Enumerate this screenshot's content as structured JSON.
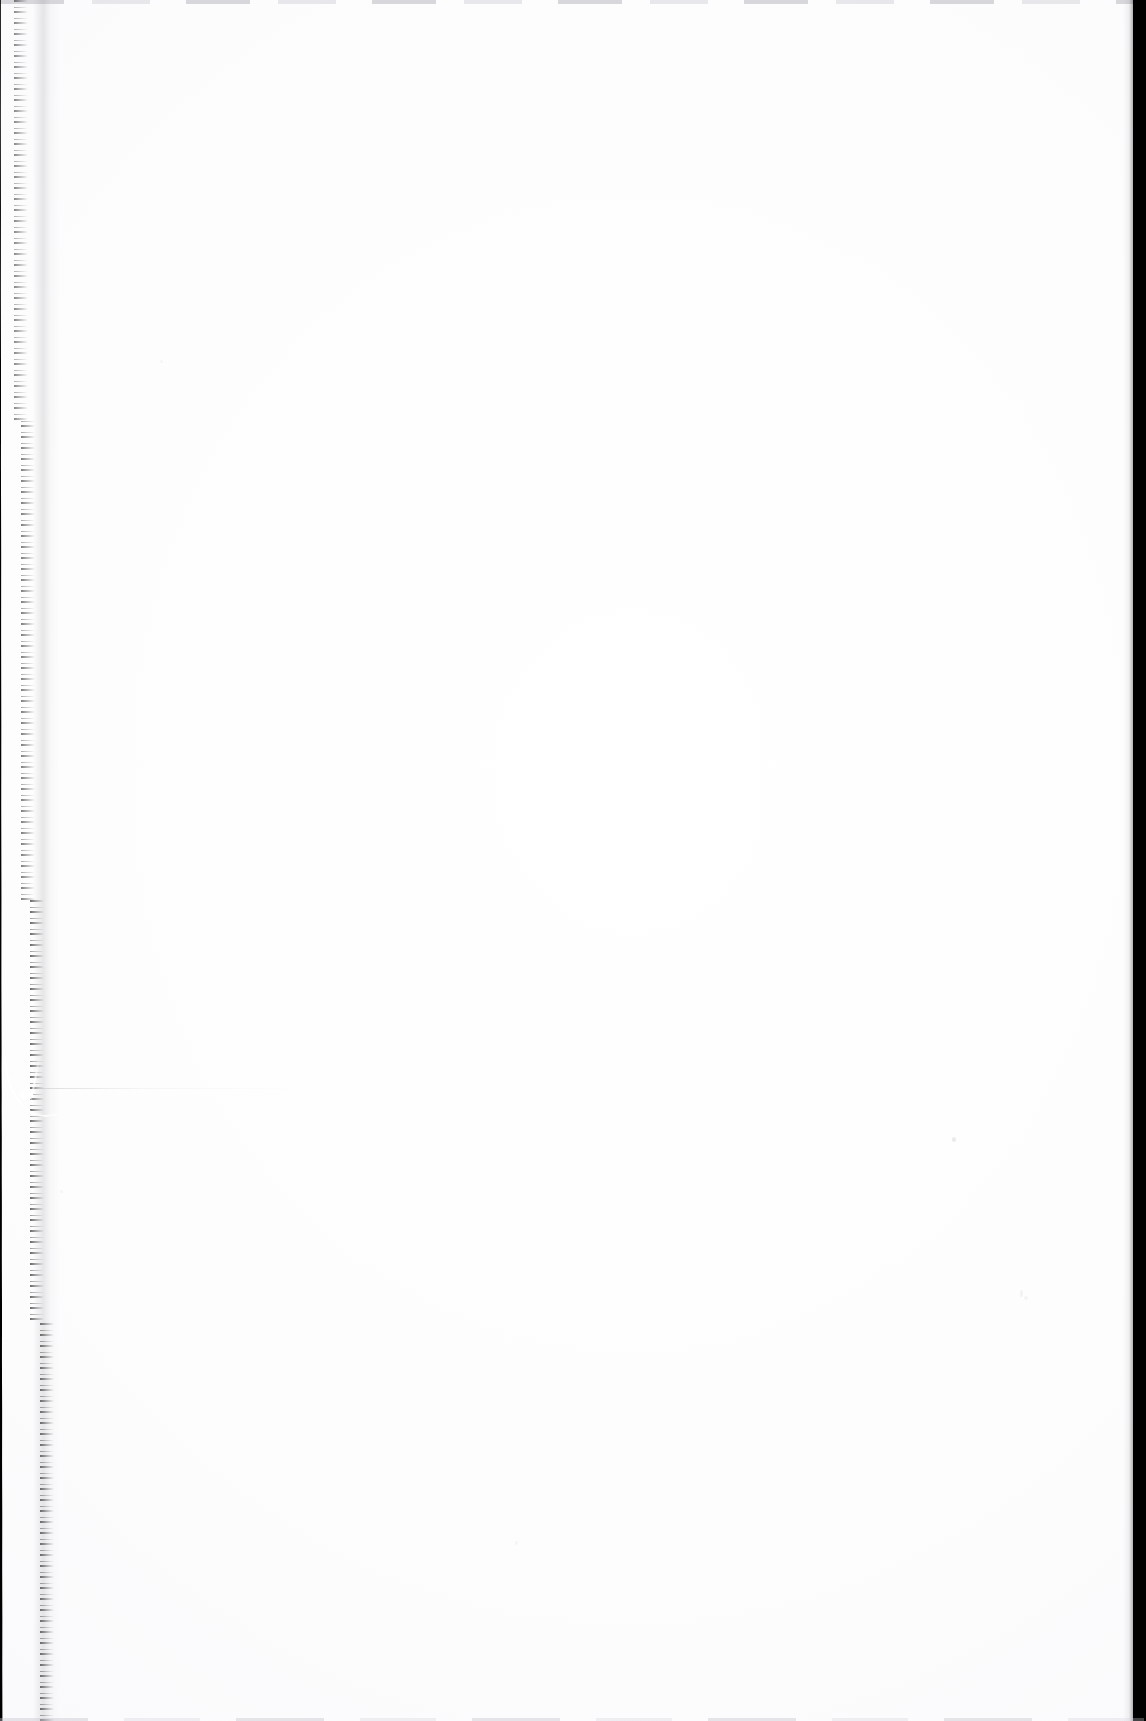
{
  "document": {
    "kind": "scanned-page",
    "page_content_text": "",
    "page_is_blank": true,
    "alt_text": "Scanned blank page with dark binding gutter along the left edge"
  },
  "canvas": {
    "width_px": 1146,
    "height_px": 1721,
    "paper_color": "#ffffff",
    "gutter_color": "#000000"
  },
  "artifacts": {
    "left_gutter": {
      "name": "binding-gutter",
      "edge": "left",
      "width_top_px": 16,
      "width_bottom_px": 52,
      "color": "#000000"
    },
    "right_strip": {
      "name": "edge-strip",
      "edge": "right",
      "width_px": 13,
      "color": "#000000"
    },
    "tear_flap": {
      "name": "torn-corner-flap",
      "top_px": 1055,
      "height_px": 62
    },
    "edge_lines": {
      "top_color": "#b2b2ba",
      "bottom_color": "#c4c4cc"
    }
  }
}
